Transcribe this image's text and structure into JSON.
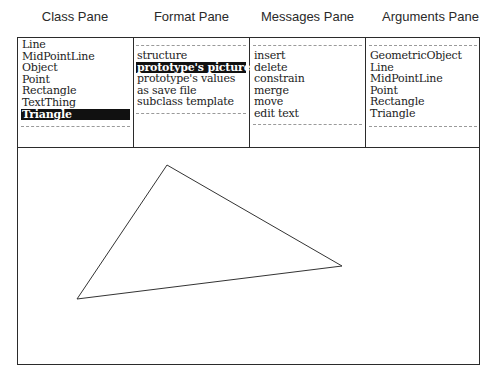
{
  "captions": {
    "class_pane": "Class Pane",
    "format_pane": "Format Pane",
    "messages_pane": "Messages Pane",
    "arguments_pane": "Arguments Pane"
  },
  "class_pane": {
    "items": [
      "Line",
      "MidPointLine",
      "Object",
      "Point",
      "Rectangle",
      "TextThing",
      "Triangle"
    ],
    "selected": "Triangle"
  },
  "format_pane": {
    "items": [
      "structure",
      "prototype's picture",
      "prototype's values",
      "as save file",
      "subclass template"
    ],
    "selected": "prototype's picture"
  },
  "messages_pane": {
    "items": [
      "insert",
      "delete",
      "constrain",
      "merge",
      "move",
      "edit text"
    ]
  },
  "arguments_pane": {
    "items": [
      "GeometricObject",
      "Line",
      "MidPointLine",
      "Point",
      "Rectangle",
      "Triangle"
    ]
  },
  "picture_pane": {
    "shape": "triangle",
    "vertices": [
      [
        167,
        165
      ],
      [
        342,
        266
      ],
      [
        77,
        299
      ]
    ],
    "stroke": "#333333"
  }
}
